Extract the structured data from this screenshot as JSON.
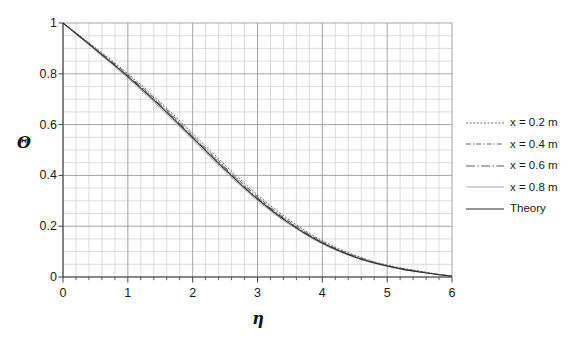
{
  "chart_data": {
    "type": "line",
    "title": "",
    "subtitle": "",
    "xlabel": "η",
    "ylabel": "Θ",
    "xlim": [
      0,
      6
    ],
    "ylim": [
      0,
      1
    ],
    "x_major_step": 1,
    "y_major_step": 0.2,
    "x_minor_divisions": 5,
    "y_minor_divisions": 4,
    "grid": "both",
    "legend_position": "right",
    "x_tick_labels": [
      "0",
      "1",
      "2",
      "3",
      "4",
      "5",
      "6"
    ],
    "y_tick_labels": [
      "0",
      "0.2",
      "0.4",
      "0.6",
      "0.8",
      "1"
    ],
    "x": [
      0,
      0.25,
      0.5,
      0.75,
      1,
      1.25,
      1.5,
      1.75,
      2,
      2.25,
      2.5,
      2.75,
      3,
      3.25,
      3.5,
      3.75,
      4,
      4.25,
      4.5,
      4.75,
      5,
      5.25,
      5.5,
      5.75,
      6
    ],
    "series": [
      {
        "name": "x = 0.2 m",
        "style": "dotted",
        "color": "#6e6e6e",
        "width": 1.0,
        "values": [
          1,
          0.952,
          0.903,
          0.853,
          0.801,
          0.746,
          0.688,
          0.628,
          0.566,
          0.503,
          0.441,
          0.381,
          0.324,
          0.271,
          0.223,
          0.18,
          0.143,
          0.112,
          0.086,
          0.064,
          0.047,
          0.034,
          0.023,
          0.012,
          0.004
        ]
      },
      {
        "name": "x = 0.4 m",
        "style": "dashdot",
        "color": "#656565",
        "width": 1.0,
        "values": [
          1,
          0.95,
          0.9,
          0.849,
          0.796,
          0.74,
          0.682,
          0.621,
          0.558,
          0.495,
          0.433,
          0.373,
          0.317,
          0.264,
          0.217,
          0.175,
          0.139,
          0.108,
          0.083,
          0.062,
          0.045,
          0.032,
          0.022,
          0.012,
          0.004
        ]
      },
      {
        "name": "x = 0.6 m",
        "style": "longdash",
        "color": "#5c5c5c",
        "width": 1.0,
        "values": [
          1,
          0.949,
          0.897,
          0.846,
          0.792,
          0.736,
          0.677,
          0.616,
          0.553,
          0.49,
          0.428,
          0.368,
          0.312,
          0.26,
          0.213,
          0.172,
          0.136,
          0.106,
          0.081,
          0.06,
          0.044,
          0.031,
          0.021,
          0.011,
          0.004
        ]
      },
      {
        "name": "x = 0.8 m",
        "style": "solid",
        "color": "#a8a8a8",
        "width": 1.0,
        "values": [
          1,
          0.946,
          0.892,
          0.838,
          0.783,
          0.725,
          0.665,
          0.603,
          0.54,
          0.477,
          0.415,
          0.356,
          0.301,
          0.25,
          0.205,
          0.165,
          0.13,
          0.101,
          0.077,
          0.057,
          0.042,
          0.029,
          0.02,
          0.011,
          0.003
        ]
      },
      {
        "name": "Theory",
        "style": "solid",
        "color": "#2b2b2b",
        "width": 1.1,
        "values": [
          1,
          0.948,
          0.896,
          0.843,
          0.789,
          0.732,
          0.673,
          0.611,
          0.548,
          0.485,
          0.423,
          0.363,
          0.307,
          0.256,
          0.21,
          0.169,
          0.134,
          0.104,
          0.079,
          0.059,
          0.043,
          0.03,
          0.02,
          0.011,
          0.003
        ]
      }
    ]
  },
  "legend": {
    "items": [
      {
        "label": "x = 0.2 m"
      },
      {
        "label": "x = 0.4 m"
      },
      {
        "label": "x = 0.6 m"
      },
      {
        "label": "x = 0.8 m"
      },
      {
        "label": "Theory"
      }
    ]
  },
  "axes": {
    "y_title": "Θ",
    "x_title": "η"
  },
  "colors": {
    "background": "#ffffff",
    "axis": "#404040",
    "grid_major": "#9a9a9a",
    "grid_minor": "#cfcfcf",
    "text": "#1a1a1a"
  }
}
